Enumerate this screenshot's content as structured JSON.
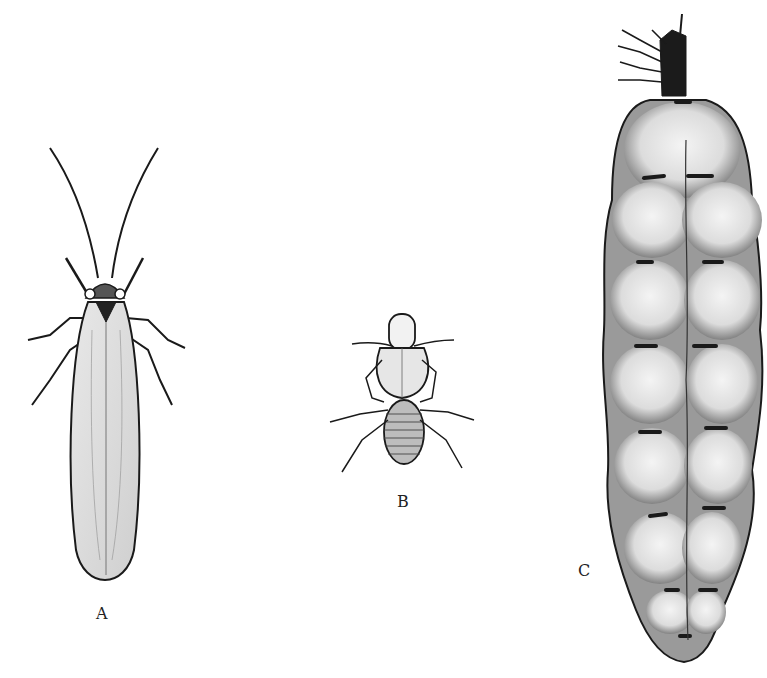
{
  "figure": {
    "panels": [
      {
        "id": "A",
        "label": "A",
        "subject": "winged-termite"
      },
      {
        "id": "B",
        "label": "B",
        "subject": "soldier-termite"
      },
      {
        "id": "C",
        "label": "C",
        "subject": "termite-queen"
      }
    ]
  },
  "colors": {
    "ink": "#1a1a1a",
    "stipple": "#8a8a8a",
    "paper": "#ffffff"
  }
}
